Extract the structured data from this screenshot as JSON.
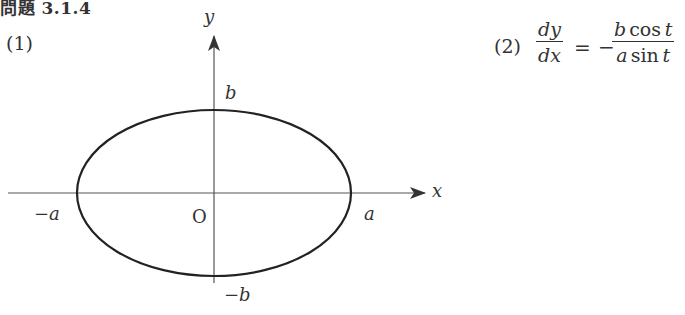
{
  "problem": {
    "title_prefix": "問題",
    "title_number": "3.1.4"
  },
  "part1": {
    "label": "(1)",
    "figure": {
      "type": "ellipse-graph",
      "center_label": "O",
      "x_axis_label": "x",
      "y_axis_label": "y",
      "x_intercepts": [
        "−a",
        "a"
      ],
      "y_intercepts": [
        "b",
        "−b"
      ],
      "label_neg_a": "−a",
      "label_a": "a",
      "label_b": "b",
      "label_neg_b": "−b"
    }
  },
  "part2": {
    "label": "(2)",
    "lhs_num": "dy",
    "lhs_den": "dx",
    "equals": "=",
    "minus": "−",
    "rhs_num_b": "b",
    "rhs_num_func": "cos",
    "rhs_num_t": "t",
    "rhs_den_a": "a",
    "rhs_den_func": "sin",
    "rhs_den_t": "t"
  }
}
